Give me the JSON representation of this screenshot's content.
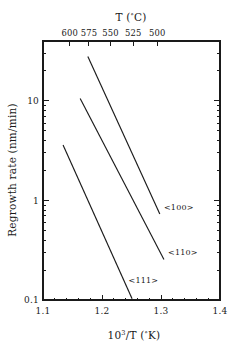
{
  "chart_data": {
    "type": "line",
    "title": "",
    "xlabel": "10^3/T  (°K)",
    "ylabel": "Regrowth rate  (nm/min)",
    "xlabel_parts": {
      "base": "10",
      "exponent": "3",
      "rest": "/T  (",
      "degree": "°",
      "unit": "K)"
    },
    "secondary_xlabel": "T  (°C)",
    "secondary_xlabel_parts": {
      "lead": "T  (",
      "degree": "°",
      "unit": "C)"
    },
    "xscale": "linear",
    "yscale": "log",
    "xlim": [
      1.1,
      1.4
    ],
    "ylim": [
      0.1,
      40
    ],
    "grid": false,
    "legend": "inline-annotations",
    "xticks": [
      1.1,
      1.2,
      1.3,
      1.4
    ],
    "xticklabels": [
      "1.1",
      "1.2",
      "1.3",
      "1.4"
    ],
    "yticks": [
      0.1,
      1,
      10
    ],
    "yticklabels": [
      "0.1",
      "1",
      "10"
    ],
    "yminorticks": [
      0.2,
      0.3,
      0.4,
      0.5,
      0.6,
      0.7,
      0.8,
      0.9,
      2,
      3,
      4,
      5,
      6,
      7,
      8,
      9,
      20,
      30,
      40
    ],
    "secondary_xticks_celsius": [
      600,
      575,
      550,
      525,
      500
    ],
    "secondary_xticklabels": [
      "600",
      "575",
      "550",
      "525",
      "500"
    ],
    "secondary_xtick_positions_inv_kelvin": [
      1.1455,
      1.1779,
      1.2146,
      1.2531,
      1.2937
    ],
    "series": [
      {
        "name": "<100>",
        "label": "<100>",
        "points": [
          [
            1.176,
            28.0
          ],
          [
            1.298,
            0.73
          ]
        ],
        "label_position": [
          1.305,
          0.8
        ]
      },
      {
        "name": "<110>",
        "label": "<110>",
        "points": [
          [
            1.163,
            10.6
          ],
          [
            1.305,
            0.255
          ]
        ],
        "label_position": [
          1.312,
          0.285
        ]
      },
      {
        "name": "<111>",
        "label": "<111>",
        "points": [
          [
            1.134,
            3.6
          ],
          [
            1.251,
            0.103
          ]
        ],
        "label_position": [
          1.245,
          0.148
        ]
      }
    ]
  },
  "colors": {
    "foreground": "#1a1a1a",
    "background": "#ffffff"
  }
}
